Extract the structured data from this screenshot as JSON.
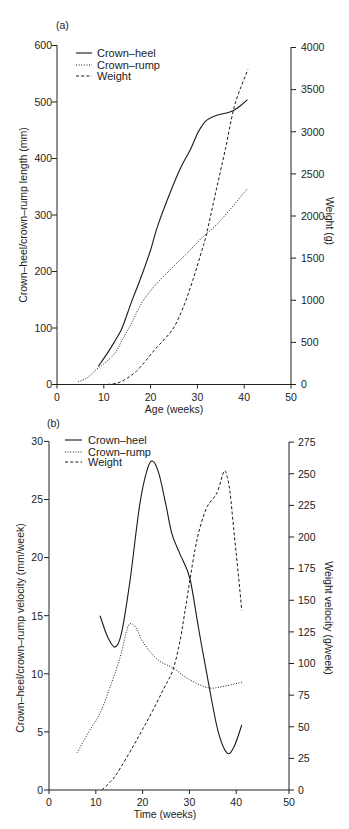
{
  "chart_data": [
    {
      "panel_label": "(a)",
      "type": "line",
      "title": "",
      "xlabel": "Age (weeks)",
      "ylabel": "Crown–heel/crown–rump length (mm)",
      "y2label": "Weight (g)",
      "xlim": [
        0,
        50
      ],
      "ylim": [
        0,
        600
      ],
      "y2lim": [
        0,
        4000
      ],
      "xticks": [
        0,
        10,
        20,
        30,
        40,
        50
      ],
      "yticks": [
        0,
        100,
        200,
        300,
        400,
        500,
        600
      ],
      "y2ticks": [
        0,
        500,
        1000,
        1500,
        2000,
        2500,
        3000,
        3500,
        4000
      ],
      "grid": false,
      "legend_position": "upper left",
      "series": [
        {
          "name": "Crown–heel",
          "axis": "left",
          "style": "solid",
          "points": [
            [
              8.8,
              32
            ],
            [
              10.5,
              52
            ],
            [
              12.3,
              76
            ],
            [
              13.9,
              100
            ],
            [
              16,
              148
            ],
            [
              17.7,
              184
            ],
            [
              20,
              238
            ],
            [
              21.4,
              278
            ],
            [
              24.1,
              338
            ],
            [
              26.5,
              385
            ],
            [
              28.4,
              414
            ],
            [
              30,
              444
            ],
            [
              31,
              458
            ],
            [
              32,
              468
            ],
            [
              34,
              476
            ],
            [
              36,
              480
            ],
            [
              37.7,
              485
            ],
            [
              39,
              492
            ],
            [
              40.7,
              504
            ]
          ]
        },
        {
          "name": "Crown–rump",
          "axis": "left",
          "style": "dotted",
          "points": [
            [
              4.5,
              5
            ],
            [
              6.5,
              12
            ],
            [
              8.6,
              28
            ],
            [
              10.5,
              40
            ],
            [
              12.5,
              57
            ],
            [
              14,
              80
            ],
            [
              16,
              110
            ],
            [
              18,
              143
            ],
            [
              20,
              166
            ],
            [
              22,
              185
            ],
            [
              25,
              210
            ],
            [
              28,
              234
            ],
            [
              31,
              260
            ],
            [
              34,
              282
            ],
            [
              37,
              310
            ],
            [
              40.7,
              347
            ]
          ]
        },
        {
          "name": "Weight",
          "axis": "right",
          "style": "dashed",
          "points": [
            [
              10.8,
              0
            ],
            [
              13,
              18
            ],
            [
              15,
              75
            ],
            [
              17,
              160
            ],
            [
              19,
              285
            ],
            [
              21,
              420
            ],
            [
              23,
              540
            ],
            [
              25,
              680
            ],
            [
              27,
              920
            ],
            [
              29,
              1234
            ],
            [
              31,
              1600
            ],
            [
              32,
              1800
            ],
            [
              34,
              2300
            ],
            [
              36,
              2800
            ],
            [
              38,
              3320
            ],
            [
              40.8,
              3740
            ]
          ]
        }
      ]
    },
    {
      "panel_label": "(b)",
      "type": "line",
      "title": "",
      "xlabel": "Time (weeks)",
      "ylabel": "Crown–heel/crown–rump velocity (mm/week)",
      "y2label": "Weight velocity (g/week)",
      "xlim": [
        0,
        50
      ],
      "ylim": [
        0,
        30
      ],
      "y2lim": [
        0,
        275
      ],
      "xticks": [
        0,
        10,
        20,
        30,
        40,
        50
      ],
      "yticks": [
        0,
        5,
        10,
        15,
        20,
        25,
        30
      ],
      "y2ticks": [
        0,
        25,
        50,
        75,
        100,
        125,
        150,
        175,
        200,
        225,
        250,
        275
      ],
      "grid": false,
      "legend_position": "upper left",
      "series": [
        {
          "name": "Crown–heel",
          "axis": "left",
          "style": "solid",
          "points": [
            [
              10.9,
              15
            ],
            [
              12.5,
              13.2
            ],
            [
              14.1,
              12.3
            ],
            [
              15.5,
              13.5
            ],
            [
              17.3,
              18
            ],
            [
              19.4,
              24.6
            ],
            [
              21,
              27.6
            ],
            [
              22.2,
              28.3
            ],
            [
              23.5,
              27.2
            ],
            [
              25,
              24.5
            ],
            [
              26.3,
              22
            ],
            [
              28,
              20.3
            ],
            [
              30.1,
              18.2
            ],
            [
              32,
              13.8
            ],
            [
              34,
              9.4
            ],
            [
              36.1,
              5.1
            ],
            [
              38,
              3.2
            ],
            [
              39.5,
              3.7
            ],
            [
              41.2,
              5.6
            ]
          ]
        },
        {
          "name": "Crown–rump",
          "axis": "left",
          "style": "dotted",
          "points": [
            [
              6,
              3.2
            ],
            [
              8.5,
              5
            ],
            [
              10.9,
              6.6
            ],
            [
              13,
              8.8
            ],
            [
              15.2,
              11.4
            ],
            [
              16.5,
              13.6
            ],
            [
              17.3,
              14.3
            ],
            [
              18.5,
              14
            ],
            [
              20,
              12.8
            ],
            [
              22,
              11.7
            ],
            [
              24,
              11
            ],
            [
              26.5,
              10.5
            ],
            [
              30,
              9.5
            ],
            [
              34,
              8.8
            ],
            [
              37,
              8.9
            ],
            [
              41.5,
              9.3
            ]
          ]
        },
        {
          "name": "Weight",
          "axis": "right",
          "style": "dashed",
          "points": [
            [
              11.3,
              0
            ],
            [
              13,
              6
            ],
            [
              14.5,
              13
            ],
            [
              17.9,
              34
            ],
            [
              20,
              48
            ],
            [
              22.2,
              63
            ],
            [
              24.5,
              80
            ],
            [
              26.5,
              95
            ],
            [
              28,
              118
            ],
            [
              29,
              140
            ],
            [
              30.1,
              166
            ],
            [
              31.2,
              190
            ],
            [
              32.3,
              208
            ],
            [
              33.8,
              224
            ],
            [
              35.9,
              235
            ],
            [
              37.4,
              252
            ],
            [
              38.1,
              247
            ],
            [
              38.7,
              235
            ],
            [
              39.5,
              205
            ],
            [
              40.2,
              180
            ],
            [
              41.2,
              142
            ]
          ]
        }
      ]
    }
  ]
}
